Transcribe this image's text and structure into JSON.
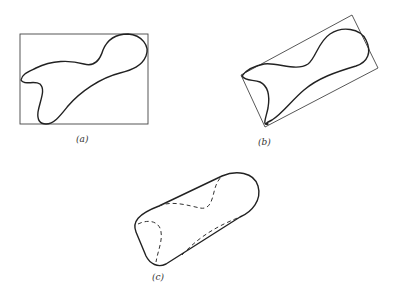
{
  "figure": {
    "panels": [
      {
        "id": "a",
        "label": "(a)",
        "description": "Irregular closed curve inscribed in an axis-aligned bounding rectangle"
      },
      {
        "id": "b",
        "label": "(b)",
        "description": "Same closed curve inscribed in a rotated (minimum-area) bounding rectangle"
      },
      {
        "id": "c",
        "label": "(c)",
        "description": "Convex hull of the curve; concave portions shown dashed"
      }
    ]
  },
  "colors": {
    "stroke": "#222222",
    "background": "#ffffff"
  }
}
